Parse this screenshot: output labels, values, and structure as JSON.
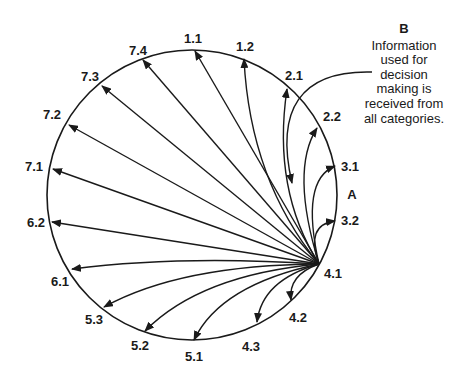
{
  "diagram": {
    "circle": {
      "cx": 192,
      "cy": 195,
      "r": 145
    },
    "hub": {
      "id": "4.1",
      "x": 319,
      "y": 264
    },
    "region_label": "A",
    "note": {
      "title": "B",
      "lines": [
        "Information",
        "used for",
        "decision",
        "making is",
        "received from",
        "all categories."
      ]
    },
    "nodes": [
      {
        "id": "1.1",
        "label": "1.1"
      },
      {
        "id": "1.2",
        "label": "1.2"
      },
      {
        "id": "2.1",
        "label": "2.1"
      },
      {
        "id": "2.2",
        "label": "2.2"
      },
      {
        "id": "3.1",
        "label": "3.1"
      },
      {
        "id": "3.2",
        "label": "3.2"
      },
      {
        "id": "4.1",
        "label": "4.1"
      },
      {
        "id": "4.2",
        "label": "4.2"
      },
      {
        "id": "4.3",
        "label": "4.3"
      },
      {
        "id": "5.1",
        "label": "5.1"
      },
      {
        "id": "5.2",
        "label": "5.2"
      },
      {
        "id": "5.3",
        "label": "5.3"
      },
      {
        "id": "6.1",
        "label": "6.1"
      },
      {
        "id": "6.2",
        "label": "6.2"
      },
      {
        "id": "7.1",
        "label": "7.1"
      },
      {
        "id": "7.2",
        "label": "7.2"
      },
      {
        "id": "7.3",
        "label": "7.3"
      },
      {
        "id": "7.4",
        "label": "7.4"
      }
    ],
    "edges": [
      {
        "from": "4.1",
        "to": "1.1"
      },
      {
        "from": "4.1",
        "to": "1.2"
      },
      {
        "from": "4.1",
        "to": "2.1"
      },
      {
        "from": "4.1",
        "to": "2.2"
      },
      {
        "from": "4.1",
        "to": "3.1"
      },
      {
        "from": "4.1",
        "to": "3.2"
      },
      {
        "from": "4.1",
        "to": "4.2"
      },
      {
        "from": "4.1",
        "to": "4.3"
      },
      {
        "from": "4.1",
        "to": "5.1"
      },
      {
        "from": "4.1",
        "to": "5.2"
      },
      {
        "from": "4.1",
        "to": "5.3"
      },
      {
        "from": "4.1",
        "to": "6.1"
      },
      {
        "from": "4.1",
        "to": "6.2"
      },
      {
        "from": "4.1",
        "to": "7.1"
      },
      {
        "from": "4.1",
        "to": "7.2"
      },
      {
        "from": "4.1",
        "to": "7.3"
      },
      {
        "from": "4.1",
        "to": "7.4"
      },
      {
        "from": "B",
        "to": "4.1 region"
      }
    ]
  }
}
